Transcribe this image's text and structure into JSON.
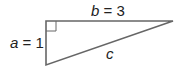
{
  "diagram": {
    "type": "right-triangle",
    "colors": {
      "stroke": "#666666",
      "text": "#222222",
      "background": "#ffffff"
    },
    "vertices": {
      "right_angle": {
        "x": 46,
        "y": 21
      },
      "top_right": {
        "x": 173,
        "y": 21
      },
      "bottom_left": {
        "x": 46,
        "y": 65
      }
    },
    "labels": {
      "a": {
        "var": "a",
        "eq": " = ",
        "value": "1"
      },
      "b": {
        "var": "b",
        "eq": " = ",
        "value": "3"
      },
      "c": {
        "var": "c"
      }
    },
    "right_angle_marker": true
  }
}
